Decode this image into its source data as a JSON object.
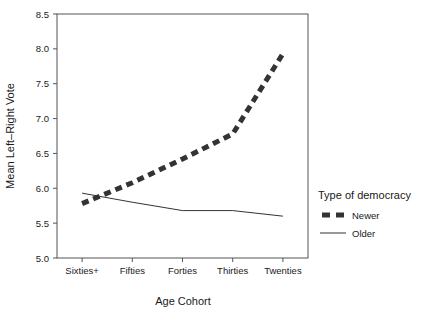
{
  "chart_data": {
    "type": "line",
    "title": "",
    "xlabel": "Age Cohort",
    "ylabel": "Mean Left–Right Vote",
    "categories": [
      "Sixties+",
      "Fifties",
      "Forties",
      "Thirties",
      "Twenties"
    ],
    "ylim": [
      5.0,
      8.5
    ],
    "yticks": [
      "5.0",
      "5.5",
      "6.0",
      "6.5",
      "7.0",
      "7.5",
      "8.0",
      "8.5"
    ],
    "ytick_values": [
      5.0,
      5.5,
      6.0,
      6.5,
      7.0,
      7.5,
      8.0,
      8.5
    ],
    "grid": false,
    "legend_position": "right",
    "series": [
      {
        "name": "Newer",
        "values": [
          5.78,
          6.08,
          6.42,
          6.78,
          7.93
        ],
        "style": "thick-dashed",
        "color": "#333333",
        "width": 5
      },
      {
        "name": "Older",
        "values": [
          5.93,
          5.8,
          5.68,
          5.68,
          5.6
        ],
        "style": "thin-solid",
        "color": "#333333",
        "width": 1
      }
    ]
  },
  "legend": {
    "title": "Type of democracy",
    "items": [
      {
        "label": "Newer"
      },
      {
        "label": "Older"
      }
    ]
  },
  "axes": {
    "x_title": "Age Cohort",
    "y_title": "Mean Left–Right Vote"
  }
}
